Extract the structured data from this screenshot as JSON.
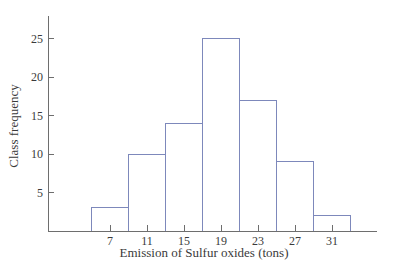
{
  "chart_data": {
    "type": "bar",
    "subtype": "histogram",
    "title": "",
    "xlabel": "Emission of Sulfur oxides (tons)",
    "ylabel": "Class frequency",
    "categories": [
      7,
      11,
      15,
      19,
      23,
      27,
      31
    ],
    "values": [
      3,
      10,
      14,
      25,
      17,
      9,
      2
    ],
    "class_width": 4,
    "class_boundaries": [
      5,
      9,
      13,
      17,
      21,
      25,
      29,
      33
    ],
    "x_tick_labels": [
      "7",
      "11",
      "15",
      "19",
      "23",
      "27",
      "31"
    ],
    "y_tick_labels": [
      "5",
      "10",
      "15",
      "20",
      "25"
    ],
    "y_ticks": [
      5,
      10,
      15,
      20,
      25
    ],
    "ylim": [
      0,
      27.9
    ],
    "xlim": [
      0.3,
      35.6
    ],
    "grid": false,
    "legend": null,
    "colors": {
      "bar_fill": "#ffffff",
      "bar_stroke": "#7d88bb",
      "axis": "#6e6e6e",
      "text": "#3a3a3a",
      "background": "#ffffff"
    }
  }
}
